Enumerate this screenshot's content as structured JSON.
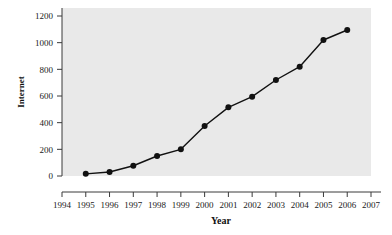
{
  "chart_data": {
    "type": "line",
    "title": "",
    "xlabel": "Year",
    "ylabel": "Internet",
    "x": [
      1995,
      1996,
      1997,
      1998,
      1999,
      2000,
      2001,
      2002,
      2003,
      2004,
      2005,
      2006
    ],
    "values": [
      16,
      30,
      77,
      150,
      200,
      375,
      515,
      595,
      720,
      820,
      1020,
      1095
    ],
    "xticks": [
      1994,
      1995,
      1996,
      1997,
      1998,
      1999,
      2000,
      2001,
      2002,
      2003,
      2004,
      2005,
      2006,
      2007
    ],
    "yticks": [
      0,
      200,
      400,
      600,
      800,
      1000,
      1200
    ],
    "xlim": [
      1994,
      2007
    ],
    "ylim": [
      0,
      1200
    ],
    "grid": false,
    "legend": null,
    "marker": "filled-circle",
    "series_color": "#111111",
    "plot_background": "#e9e9e9"
  },
  "axis": {
    "y_tick_labels": [
      "1200",
      "1000",
      "800",
      "600",
      "400",
      "200",
      "0"
    ],
    "x_tick_labels": [
      "1994",
      "1995",
      "1996",
      "1997",
      "1998",
      "1999",
      "2000",
      "2001",
      "2002",
      "2003",
      "2004",
      "2005",
      "2006",
      "2007"
    ],
    "y_title": "Internet",
    "x_title": "Year"
  },
  "colors": {
    "axis": "#3a3a3a",
    "line": "#111111",
    "marker": "#0d0d0d",
    "panel": "#e9e9e9",
    "page": "#ffffff"
  }
}
